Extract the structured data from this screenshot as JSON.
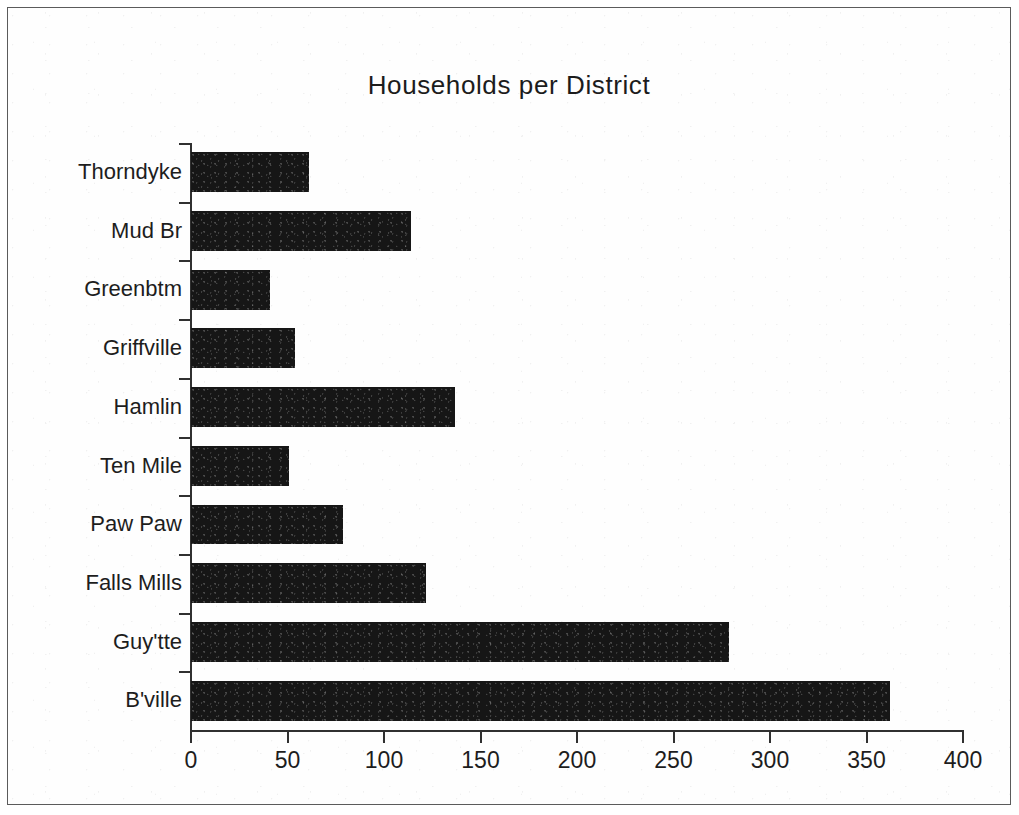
{
  "chart_data": {
    "type": "bar",
    "orientation": "horizontal",
    "title": "Households per District",
    "xlabel": "",
    "ylabel": "",
    "categories": [
      "Thorndyke",
      "Mud Br",
      "Greenbtm",
      "Griffville",
      "Hamlin",
      "Ten Mile",
      "Paw Paw",
      "Falls Mills",
      "Guy'tte",
      "B'ville"
    ],
    "values": [
      61,
      114,
      41,
      54,
      137,
      51,
      79,
      122,
      279,
      362
    ],
    "xlim": [
      0,
      400
    ],
    "xticks": [
      0,
      50,
      100,
      150,
      200,
      250,
      300,
      350,
      400
    ],
    "xtick_labels": [
      "0",
      "50",
      "100",
      "150",
      "200",
      "250",
      "300",
      "350",
      "400"
    ],
    "grid": false,
    "legend": null,
    "bar_color": "#161616",
    "axis_color": "#303030",
    "text_color": "#1d1d1d",
    "background_color": "#ffffff"
  }
}
